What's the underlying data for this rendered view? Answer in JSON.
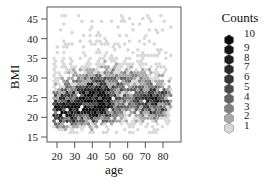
{
  "chart_data": {
    "type": "heatmap",
    "subtype": "hexbin",
    "title": "",
    "xlabel": "age",
    "ylabel": "BMI",
    "xlim": [
      15,
      87
    ],
    "ylim": [
      14,
      47
    ],
    "x_ticks": [
      20,
      30,
      40,
      50,
      60,
      70,
      80
    ],
    "y_ticks": [
      15,
      20,
      25,
      30,
      35,
      40,
      45
    ],
    "grid": false,
    "legend": {
      "title": "Counts",
      "position": "right",
      "levels": [
        {
          "count": 10,
          "color": "#0a0a0a"
        },
        {
          "count": 9,
          "color": "#141414"
        },
        {
          "count": 8,
          "color": "#1e1e1e"
        },
        {
          "count": 7,
          "color": "#2a2a2a"
        },
        {
          "count": 6,
          "color": "#363636"
        },
        {
          "count": 5,
          "color": "#4a4a4a"
        },
        {
          "count": 4,
          "color": "#636363"
        },
        {
          "count": 3,
          "color": "#808080"
        },
        {
          "count": 2,
          "color": "#a8a8a8"
        },
        {
          "count": 1,
          "color": "#d8d8d8"
        }
      ]
    },
    "density_regions": [
      {
        "x_center": 25,
        "y_center": 22,
        "x_spread": 6,
        "y_spread": 2.5,
        "peak_count": 10
      },
      {
        "x_center": 42,
        "y_center": 24,
        "x_spread": 6,
        "y_spread": 3,
        "peak_count": 10
      },
      {
        "x_center": 75,
        "y_center": 24,
        "x_spread": 6,
        "y_spread": 2.5,
        "peak_count": 6
      },
      {
        "x_center": 50,
        "y_center": 26,
        "x_spread": 22,
        "y_spread": 5,
        "peak_count": 3
      }
    ],
    "x_range_of_data": [
      18,
      85
    ],
    "y_range_of_data": [
      16,
      46
    ]
  }
}
